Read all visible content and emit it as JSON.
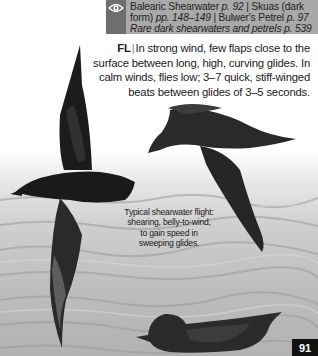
{
  "xref": {
    "icon": "eye-icon",
    "line1_a": "Balearic Shearwater ",
    "line1_p": "p. 92",
    "line1_sep": " | ",
    "line1_b": "Skuas (dark",
    "line2_a": "form) ",
    "line2_p": "pp. 148–149",
    "line2_sep": " | ",
    "line2_b": "Bulwer's Petrel ",
    "line2_p2": "p. 97",
    "line3": "Rare dark shearwaters and petrels p. 539"
  },
  "flight": {
    "label": "FL",
    "separator": "|",
    "text": "In strong wind, few flaps close to the surface between long, high, curving glides. In calm winds, flies low; 3–7 quick, stiff-winged beats between glides of 3–5 seconds."
  },
  "caption": {
    "text": "Typical shearwater flight: shearing, belly-to-wind, to gain speed in sweeping glides."
  },
  "page_number": "91",
  "colors": {
    "xref_box": "#a9a9a9",
    "xref_icon_col": "#6e6e6e",
    "page_badge": "#111111"
  }
}
